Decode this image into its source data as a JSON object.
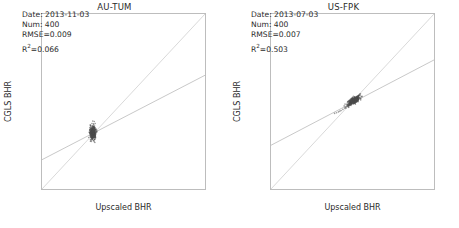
{
  "figure": {
    "width": 459,
    "height": 228,
    "background": "#ffffff"
  },
  "axis_common": {
    "xlabel": "Upscaled BHR",
    "ylabel": "CGLS BHR",
    "xticks": [
      "0.00",
      "0.05",
      "0.10",
      "0.15",
      "0.20",
      "0.25",
      "0.30",
      "0.35",
      "0.40"
    ],
    "yticks": [
      "0.00",
      "0.05",
      "0.10",
      "0.15",
      "0.20",
      "0.25",
      "0.30",
      "0.35",
      "0.40"
    ],
    "xlim": [
      0.0,
      0.4
    ],
    "ylim": [
      0.0,
      0.4
    ],
    "grid": false,
    "tick_color": "#2b2b2b",
    "frame_color": "#bdbdbd"
  },
  "panels": [
    {
      "id": "au-tum",
      "title": "AU-TUM",
      "annotation": {
        "date_label": "Date: 2013-11-03",
        "num_label": "Num: 400",
        "rmse_label": "RMSE=0.009",
        "r2_prefix": "R",
        "r2_sup": "2",
        "r2_value": "=0.066"
      },
      "stats": {
        "date": "2013-11-03",
        "num": 400,
        "rmse": 0.009,
        "r2": 0.066
      }
    },
    {
      "id": "us-fpk",
      "title": "US-FPK",
      "annotation": {
        "date_label": "Date: 2013-07-03",
        "num_label": "Num: 400",
        "rmse_label": "RMSE=0.007",
        "r2_prefix": "R",
        "r2_sup": "2",
        "r2_value": "=0.503"
      },
      "stats": {
        "date": "2013-07-03",
        "num": 400,
        "rmse": 0.007,
        "r2": 0.503
      }
    }
  ],
  "chart_data": [
    {
      "type": "scatter",
      "id": "au-tum",
      "title": "AU-TUM",
      "xlabel": "Upscaled BHR",
      "ylabel": "CGLS BHR",
      "xlim": [
        0.0,
        0.4
      ],
      "ylim": [
        0.0,
        0.4
      ],
      "grid": false,
      "legend": "none",
      "n_points": 400,
      "annotations": [
        "Date: 2013-11-03",
        "Num: 400",
        "RMSE=0.009",
        "R2=0.066"
      ],
      "point_color": "#4d4d4d",
      "point_size": 1.6,
      "lines": [
        {
          "name": "one-to-one",
          "x": [
            0.0,
            0.4
          ],
          "y": [
            0.0,
            0.4
          ],
          "color": "#c8c8c8"
        },
        {
          "name": "regression",
          "x": [
            0.0,
            0.4
          ],
          "y": [
            0.067,
            0.26
          ],
          "color": "#b0b0b0",
          "slope": 0.4825,
          "intercept": 0.067
        }
      ],
      "cluster": {
        "x_center": 0.125,
        "y_center": 0.129,
        "x_spread": 0.008,
        "y_spread": 0.017
      },
      "x": [
        0.1261,
        0.1243,
        0.1272,
        0.1229,
        0.1255,
        0.1281,
        0.1238,
        0.1266,
        0.1217,
        0.1249,
        0.1274,
        0.1232,
        0.1259,
        0.1285,
        0.1222,
        0.1268,
        0.1241,
        0.1253,
        0.1279,
        0.1235,
        0.1264,
        0.121,
        0.1247,
        0.1276,
        0.1225,
        0.1257,
        0.1288,
        0.1233,
        0.1262,
        0.1244,
        0.1271,
        0.1219,
        0.1251,
        0.1283,
        0.1239,
        0.1265,
        0.1228,
        0.1256,
        0.1277,
        0.1214,
        0.1248,
        0.1269,
        0.1236,
        0.126,
        0.129,
        0.1223,
        0.1254,
        0.128,
        0.1242,
        0.1267,
        0.1231,
        0.1258,
        0.1275,
        0.1216,
        0.125,
        0.1286,
        0.1237,
        0.1263,
        0.1226,
        0.1252,
        0.1278,
        0.1245,
        0.127,
        0.1212,
        0.1246,
        0.1284,
        0.1234,
        0.1261,
        0.1227,
        0.1257,
        0.1273,
        0.122,
        0.1249,
        0.1287,
        0.124,
        0.1266,
        0.123,
        0.1255,
        0.1282,
        0.1243
      ],
      "y": [
        0.129,
        0.1315,
        0.1262,
        0.134,
        0.1205,
        0.1288,
        0.1355,
        0.123,
        0.1302,
        0.1268,
        0.133,
        0.1195,
        0.1285,
        0.136,
        0.1245,
        0.131,
        0.118,
        0.1295,
        0.127,
        0.1335,
        0.1225,
        0.13,
        0.1255,
        0.138,
        0.1215,
        0.1292,
        0.132,
        0.116,
        0.1278,
        0.1345,
        0.124,
        0.1305,
        0.1265,
        0.12,
        0.1325,
        0.1283,
        0.115,
        0.1296,
        0.135,
        0.1235,
        0.1275,
        0.119,
        0.1308,
        0.126,
        0.1298,
        0.137,
        0.122,
        0.1287,
        0.114,
        0.1312,
        0.1252,
        0.129,
        0.121,
        0.1328,
        0.1272,
        0.1293,
        0.1175,
        0.128,
        0.1318,
        0.1248,
        0.1301,
        0.1165,
        0.1284,
        0.1338,
        0.1258,
        0.1297,
        0.1232,
        0.1306,
        0.1185,
        0.1276,
        0.1322,
        0.1268,
        0.1289,
        0.1125,
        0.1294,
        0.125,
        0.1342,
        0.1281,
        0.1218,
        0.1303
      ]
    },
    {
      "type": "scatter",
      "id": "us-fpk",
      "title": "US-FPK",
      "xlabel": "Upscaled BHR",
      "ylabel": "CGLS BHR",
      "xlim": [
        0.0,
        0.4
      ],
      "ylim": [
        0.0,
        0.4
      ],
      "grid": false,
      "legend": "none",
      "n_points": 400,
      "annotations": [
        "Date: 2013-07-03",
        "Num: 400",
        "RMSE=0.007",
        "R2=0.503"
      ],
      "point_color": "#4d4d4d",
      "point_size": 1.6,
      "lines": [
        {
          "name": "one-to-one",
          "x": [
            0.0,
            0.4
          ],
          "y": [
            0.0,
            0.4
          ],
          "color": "#c8c8c8"
        },
        {
          "name": "regression",
          "x": [
            0.0,
            0.4
          ],
          "y": [
            0.1,
            0.295
          ],
          "color": "#b0b0b0",
          "slope": 0.4875,
          "intercept": 0.1
        }
      ],
      "cluster": {
        "x_center": 0.203,
        "y_center": 0.202,
        "x_spread": 0.016,
        "y_spread": 0.011
      },
      "x": [
        0.203,
        0.2085,
        0.1975,
        0.212,
        0.194,
        0.206,
        0.2155,
        0.1995,
        0.2045,
        0.21,
        0.196,
        0.2075,
        0.2135,
        0.201,
        0.205,
        0.211,
        0.193,
        0.2065,
        0.2145,
        0.1985,
        0.2035,
        0.2095,
        0.195,
        0.208,
        0.2125,
        0.2,
        0.2055,
        0.2105,
        0.1915,
        0.207,
        0.216,
        0.199,
        0.204,
        0.209,
        0.1965,
        0.2115,
        0.2025,
        0.215,
        0.1945,
        0.2062,
        0.2108,
        0.198,
        0.2048,
        0.213,
        0.1925,
        0.2072,
        0.214,
        0.2005,
        0.2058,
        0.2098,
        0.1955,
        0.2082,
        0.2118,
        0.2015,
        0.2042,
        0.2088,
        0.197,
        0.2068,
        0.2128,
        0.1935,
        0.2052,
        0.2102,
        0.202,
        0.2078,
        0.2148,
        0.1905,
        0.2044,
        0.2092,
        0.1878,
        0.1842,
        0.181,
        0.1765,
        0.172,
        0.169,
        0.1655,
        0.1608,
        0.156,
        0.2168,
        0.218,
        0.2195
      ],
      "y": [
        0.202,
        0.2075,
        0.1985,
        0.2105,
        0.195,
        0.205,
        0.2135,
        0.2,
        0.204,
        0.2085,
        0.1965,
        0.2065,
        0.212,
        0.2015,
        0.2045,
        0.2095,
        0.194,
        0.2058,
        0.2128,
        0.1992,
        0.203,
        0.208,
        0.1958,
        0.207,
        0.211,
        0.2005,
        0.2048,
        0.209,
        0.1925,
        0.2062,
        0.2142,
        0.1995,
        0.2035,
        0.2078,
        0.1972,
        0.21,
        0.2025,
        0.2132,
        0.1948,
        0.2055,
        0.2092,
        0.1988,
        0.2042,
        0.2115,
        0.1932,
        0.2064,
        0.2125,
        0.2008,
        0.2052,
        0.2086,
        0.1962,
        0.2072,
        0.2102,
        0.2018,
        0.2038,
        0.2076,
        0.1978,
        0.206,
        0.2112,
        0.1942,
        0.2046,
        0.2088,
        0.2022,
        0.2068,
        0.2138,
        0.1918,
        0.2036,
        0.2082,
        0.19,
        0.1872,
        0.1848,
        0.182,
        0.1795,
        0.178,
        0.1762,
        0.1742,
        0.1728,
        0.2155,
        0.2168,
        0.2178
      ]
    }
  ]
}
